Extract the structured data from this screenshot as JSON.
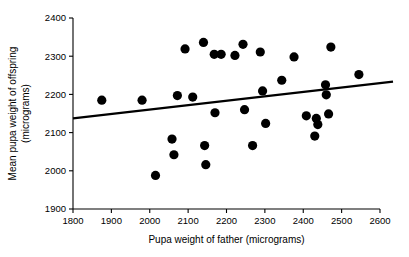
{
  "chart_data": {
    "type": "scatter",
    "title": "",
    "xlabel": "Pupa weight of father (micrograms)",
    "ylabel": "Mean pupa weight of offspring (micrograms)",
    "ylabel_line1": "Mean pupa weight of offspring",
    "ylabel_line2": "(micrograms)",
    "xlim": [
      1800,
      2600
    ],
    "ylim": [
      1900,
      2400
    ],
    "xticks": [
      1800,
      1900,
      2000,
      2100,
      2200,
      2300,
      2400,
      2500,
      2600
    ],
    "xtick_labels": [
      "1800",
      "1900",
      "2000",
      "2100",
      "2200",
      "2300",
      "2400",
      "2500",
      "2600"
    ],
    "yticks": [
      1900,
      2000,
      2100,
      2200,
      2300,
      2400
    ],
    "ytick_labels": [
      "1900",
      "2000",
      "2100",
      "2200",
      "2300",
      "2400"
    ],
    "grid": false,
    "legend": null,
    "point_color": "#000000",
    "point_size": 4.6,
    "line_color": "#000000",
    "points": [
      {
        "x": 1875,
        "y": 2185
      },
      {
        "x": 1980,
        "y": 2185
      },
      {
        "x": 2015,
        "y": 1988
      },
      {
        "x": 2058,
        "y": 2083
      },
      {
        "x": 2063,
        "y": 2042
      },
      {
        "x": 2072,
        "y": 2197
      },
      {
        "x": 2092,
        "y": 2319
      },
      {
        "x": 2112,
        "y": 2193
      },
      {
        "x": 2140,
        "y": 2336
      },
      {
        "x": 2143,
        "y": 2066
      },
      {
        "x": 2146,
        "y": 2016
      },
      {
        "x": 2168,
        "y": 2305
      },
      {
        "x": 2170,
        "y": 2152
      },
      {
        "x": 2186,
        "y": 2305
      },
      {
        "x": 2222,
        "y": 2302
      },
      {
        "x": 2243,
        "y": 2331
      },
      {
        "x": 2247,
        "y": 2160
      },
      {
        "x": 2268,
        "y": 2066
      },
      {
        "x": 2288,
        "y": 2311
      },
      {
        "x": 2294,
        "y": 2209
      },
      {
        "x": 2302,
        "y": 2124
      },
      {
        "x": 2344,
        "y": 2237
      },
      {
        "x": 2376,
        "y": 2298
      },
      {
        "x": 2408,
        "y": 2144
      },
      {
        "x": 2430,
        "y": 2091
      },
      {
        "x": 2434,
        "y": 2137
      },
      {
        "x": 2438,
        "y": 2121
      },
      {
        "x": 2458,
        "y": 2225
      },
      {
        "x": 2460,
        "y": 2199
      },
      {
        "x": 2466,
        "y": 2149
      },
      {
        "x": 2472,
        "y": 2324
      },
      {
        "x": 2545,
        "y": 2252
      }
    ],
    "fit_line": {
      "x_start": 1800,
      "y_start": 2137,
      "x_end": 2637,
      "y_end": 2234
    }
  }
}
